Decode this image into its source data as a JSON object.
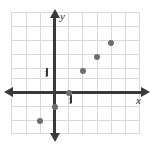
{
  "chart_data": {
    "type": "scatter",
    "title": "",
    "subtitle": "",
    "xlabel": "x",
    "ylabel": "y",
    "x": [
      -1,
      0,
      1,
      2,
      3,
      4
    ],
    "values": [
      -2,
      -1,
      0,
      1.5,
      2.5,
      3.5
    ],
    "points": [
      {
        "x": -1,
        "y": -2
      },
      {
        "x": 0,
        "y": -1
      },
      {
        "x": 1,
        "y": 0
      },
      {
        "x": 2,
        "y": 1.5
      },
      {
        "x": 3,
        "y": 2.5
      },
      {
        "x": 4,
        "y": 3.5
      }
    ],
    "xlim": [
      -3.07,
      6.14
    ],
    "ylim": [
      -3,
      5.71
    ],
    "xticks": [
      1
    ],
    "yticks": [
      1
    ],
    "xtick_labels": [
      "1"
    ],
    "ytick_labels": [
      "1"
    ],
    "grid": true,
    "grid_spacing": 1,
    "legend": null,
    "legend_position": "none",
    "annotations": []
  },
  "axes": {
    "x_axis_label": "x",
    "y_axis_label": "y",
    "x_unit_label": "1",
    "y_unit_label": "1"
  },
  "style": {
    "point_color": "#6e6e72",
    "axis_color": "#3a3a3a",
    "grid_color": "#d9d9d9",
    "background": "#ffffff",
    "label_color": "#2b2b2b"
  }
}
